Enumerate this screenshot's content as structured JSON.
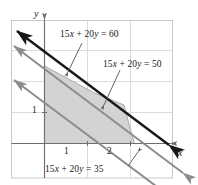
{
  "figure": {
    "kind": "linear-programming-feasible-region",
    "background_color": "#ffffff",
    "border_color": "#c8c8c8",
    "grid_color": "#d8d8d8",
    "axis_color": "#6e6e6e",
    "shade_fill": "#d2d2d2",
    "shade_stroke": "#9a9a9a",
    "bold_line_color": "#171717",
    "gray_line_color": "#8c8c8c",
    "leader_color": "#555555"
  },
  "axes": {
    "x_label": "x",
    "y_label": "y",
    "x_ticks": [
      {
        "label": "1",
        "value": 1
      },
      {
        "label": "2",
        "value": 2
      }
    ],
    "y_ticks": [
      {
        "label": "1",
        "value": 1
      }
    ],
    "x_origin_px": 44,
    "y_origin_px": 143,
    "x_unit_px": 43,
    "y_unit_px": 31
  },
  "labels": {
    "eq60": "15x + 20y = 60",
    "eq50": "15x + 20y = 50",
    "eq35": "15x + 20y = 35"
  },
  "chart_data": {
    "type": "line",
    "title": "",
    "xlabel": "x",
    "ylabel": "y",
    "xlim": [
      -0.75,
      3.0
    ],
    "ylim": [
      -1.1,
      4.0
    ],
    "grid": true,
    "legend": "inline-annotations",
    "series": [
      {
        "name": "15x + 20y = 60",
        "equation": "15x + 20y = 60",
        "slope": -0.75,
        "y_intercept": 3,
        "x_intercept": 4,
        "style": "bold-black-double-arrow",
        "color": "#171717"
      },
      {
        "name": "15x + 20y = 50",
        "equation": "15x + 20y = 50",
        "slope": -0.75,
        "y_intercept": 2.5,
        "x_intercept": 3.3333,
        "style": "gray-double-arrow",
        "color": "#8c8c8c"
      },
      {
        "name": "15x + 20y = 35",
        "equation": "15x + 20y = 35",
        "slope": -0.75,
        "y_intercept": 1.75,
        "x_intercept": 2.3333,
        "style": "gray-double-arrow",
        "color": "#8c8c8c"
      }
    ],
    "shaded_region": {
      "name": "feasible-region",
      "fill": "#d2d2d2",
      "vertices": [
        [
          0,
          0
        ],
        [
          0,
          2.5
        ],
        [
          1.15,
          1.64
        ],
        [
          1.85,
          1.25
        ],
        [
          2.0,
          0.5
        ],
        [
          2.1,
          0
        ]
      ]
    },
    "annotations": [
      {
        "text": "15x + 20y = 60",
        "points_to": [
          1.0,
          2.25
        ]
      },
      {
        "text": "15x + 20y = 50",
        "points_to": [
          1.6,
          1.18
        ]
      },
      {
        "text": "15x + 20y = 35",
        "points_to": [
          2.35,
          -0.1
        ]
      }
    ]
  }
}
